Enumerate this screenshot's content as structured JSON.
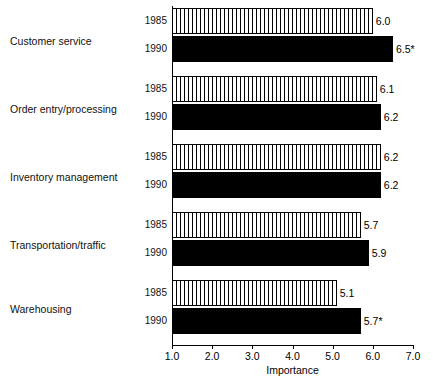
{
  "chart_data": {
    "type": "bar",
    "orientation": "horizontal",
    "title": "",
    "xlabel": "Importance",
    "ylabel": "",
    "xlim": [
      1.0,
      7.0
    ],
    "xticks": [
      "1.0",
      "2.0",
      "3.0",
      "4.0",
      "5.0",
      "6.0",
      "7.0"
    ],
    "grid": false,
    "legend": "none",
    "categories": [
      "Customer service",
      "Order entry/processing",
      "Inventory management",
      "Transportation/traffic",
      "Warehousing"
    ],
    "series": [
      {
        "name": "1985",
        "values": [
          6.0,
          6.1,
          6.2,
          5.7,
          5.1
        ],
        "labels": [
          "6.0",
          "6.1",
          "6.2",
          "5.7",
          "5.1"
        ],
        "fill": "vertical-hatch"
      },
      {
        "name": "1990",
        "values": [
          6.5,
          6.2,
          6.2,
          5.9,
          5.7
        ],
        "labels": [
          "6.5*",
          "6.2",
          "6.2",
          "5.9",
          "5.7*"
        ],
        "fill": "solid-black"
      }
    ],
    "colors": {
      "series_1985": "#ffffff",
      "series_1990": "#000000",
      "axis": "#000000",
      "background": "#ffffff"
    },
    "annotations": [
      "* denotes significance marker on value label"
    ]
  },
  "axis": {
    "x_title": "Importance"
  }
}
